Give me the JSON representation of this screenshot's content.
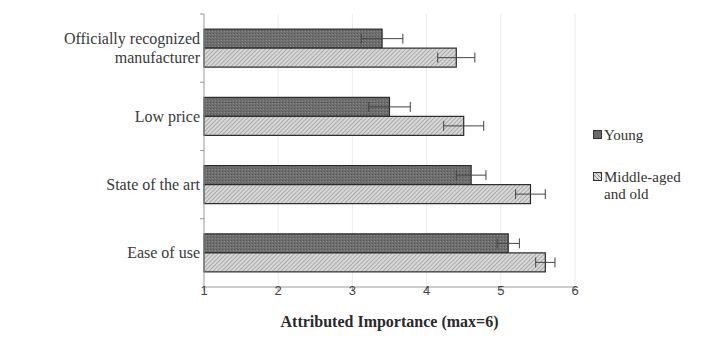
{
  "chart_data": {
    "type": "bar",
    "orientation": "horizontal",
    "title": "",
    "xlabel": "Attributed Importance (max=6)",
    "ylabel": "",
    "xlim": [
      1,
      6
    ],
    "xticks": [
      "1",
      "2",
      "3",
      "4",
      "5",
      "6"
    ],
    "categories": [
      "Officially recognized\nmanufacturer",
      "Low price",
      "State of the art",
      "Ease of use"
    ],
    "series": [
      {
        "name": "Young",
        "values": [
          3.4,
          3.5,
          4.6,
          5.1
        ],
        "errors": [
          0.28,
          0.28,
          0.2,
          0.15
        ],
        "color": "#6b6b6b",
        "pattern": "dense-dot"
      },
      {
        "name": "Middle-aged and old",
        "values": [
          4.4,
          4.5,
          5.4,
          5.6
        ],
        "errors": [
          0.25,
          0.27,
          0.2,
          0.13
        ],
        "color": "#bdbdbd",
        "pattern": "diagonal-hatch"
      }
    ],
    "grid": true,
    "legend_position": "right",
    "error_bars": true
  },
  "legend": {
    "young": "Young",
    "middle_line1": "Middle-aged",
    "middle_line2": "and old"
  }
}
